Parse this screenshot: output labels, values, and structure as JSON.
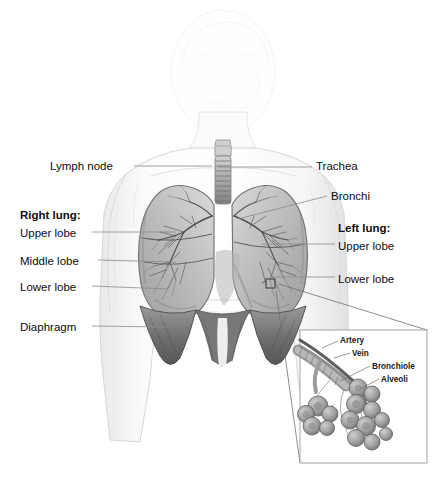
{
  "figure": {
    "style": "grayscale pencil medical illustration",
    "background_color": "#ffffff",
    "label_color": "#0d0d0d",
    "leader_line_color": "#8a8a8a"
  },
  "labels_left": [
    {
      "id": "lymph-node",
      "text": "Lymph node",
      "bold": false,
      "x": 50,
      "y": 160,
      "leader": {
        "x1": 134,
        "y1": 166,
        "x2": 212,
        "y2": 166
      }
    },
    {
      "id": "right-lung",
      "text": "Right lung:",
      "bold": true,
      "x": 20,
      "y": 209,
      "leader": null
    },
    {
      "id": "upper-lobe-r",
      "text": "Upper lobe",
      "bold": false,
      "x": 20,
      "y": 227,
      "leader": {
        "x1": 92,
        "y1": 232,
        "x2": 176,
        "y2": 232
      }
    },
    {
      "id": "middle-lobe",
      "text": "Middle lobe",
      "bold": false,
      "x": 20,
      "y": 255,
      "leader": {
        "x1": 98,
        "y1": 260,
        "x2": 176,
        "y2": 262
      }
    },
    {
      "id": "lower-lobe-r",
      "text": "Lower lobe",
      "bold": false,
      "x": 20,
      "y": 281,
      "leader": {
        "x1": 92,
        "y1": 286,
        "x2": 168,
        "y2": 289
      }
    },
    {
      "id": "diaphragm",
      "text": "Diaphragm",
      "bold": false,
      "x": 20,
      "y": 321,
      "leader": {
        "x1": 92,
        "y1": 326,
        "x2": 166,
        "y2": 327
      }
    }
  ],
  "labels_right": [
    {
      "id": "trachea",
      "text": "Trachea",
      "bold": false,
      "x": 316,
      "y": 160,
      "leader": {
        "x1": 218,
        "y1": 167,
        "x2": 312,
        "y2": 167
      }
    },
    {
      "id": "bronchi",
      "text": "Bronchi",
      "bold": false,
      "x": 331,
      "y": 190,
      "leader": {
        "x1": 238,
        "y1": 219,
        "x2": 327,
        "y2": 196
      }
    },
    {
      "id": "left-lung",
      "text": "Left lung:",
      "bold": true,
      "x": 338,
      "y": 222,
      "leader": null
    },
    {
      "id": "upper-lobe-l",
      "text": "Upper lobe",
      "bold": false,
      "x": 338,
      "y": 240,
      "leader": {
        "x1": 262,
        "y1": 244,
        "x2": 335,
        "y2": 244
      }
    },
    {
      "id": "lower-lobe-l",
      "text": "Lower lobe",
      "bold": false,
      "x": 338,
      "y": 273,
      "leader": {
        "x1": 270,
        "y1": 277,
        "x2": 335,
        "y2": 277
      }
    }
  ],
  "inset": {
    "frame": {
      "x": 300,
      "y": 330,
      "width": 127,
      "height": 133
    },
    "marker": {
      "x": 270,
      "y": 283,
      "size": 9
    },
    "connectors": [
      {
        "x1": 279,
        "y1": 284,
        "x2": 427,
        "y2": 330
      },
      {
        "x1": 276,
        "y1": 291,
        "x2": 300,
        "y2": 463
      }
    ],
    "labels": [
      {
        "id": "artery",
        "text": "Artery",
        "x": 340,
        "y": 336,
        "leader": {
          "x1": 338,
          "y1": 341,
          "x2": 322,
          "y2": 348
        }
      },
      {
        "id": "vein",
        "text": "Vein",
        "x": 352,
        "y": 349,
        "leader": {
          "x1": 350,
          "y1": 353,
          "x2": 334,
          "y2": 358
        }
      },
      {
        "id": "bronchiole",
        "text": "Bronchiole",
        "x": 372,
        "y": 362,
        "leader": {
          "x1": 370,
          "y1": 366,
          "x2": 340,
          "y2": 381
        }
      },
      {
        "id": "alveoli",
        "text": "Alveoli",
        "x": 381,
        "y": 375,
        "leader": {
          "x1": 379,
          "y1": 379,
          "x2": 360,
          "y2": 389
        }
      }
    ]
  }
}
